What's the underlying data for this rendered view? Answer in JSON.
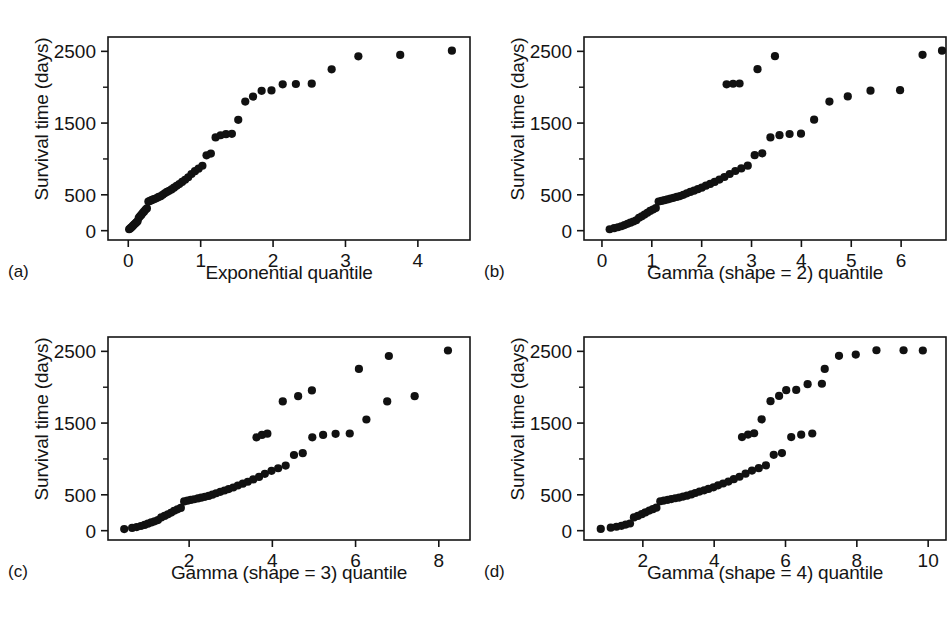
{
  "figure": {
    "background": "#ffffff",
    "ink_color": "#141414",
    "marker_color": "#111111",
    "panel_count": 4
  },
  "chart_data": [
    {
      "type": "scatter",
      "panel": "a",
      "panel_tag": "(a)",
      "title": "",
      "xlabel": "Exponential quantile",
      "ylabel": "Survival time (days)",
      "xlim": [
        -0.28,
        4.72
      ],
      "ylim": [
        -130,
        2700
      ],
      "xticks": [
        0,
        1,
        2,
        3,
        4
      ],
      "xtick_labels": [
        "0",
        "1",
        "2",
        "3",
        "4"
      ],
      "yticks": [
        0,
        500,
        1500,
        2500
      ],
      "ytick_labels": [
        "0",
        "500",
        "1500",
        "2500"
      ],
      "yminorticks": [
        1000,
        2000
      ],
      "grid": false,
      "legend": null,
      "x": [
        0.012,
        0.025,
        0.038,
        0.052,
        0.066,
        0.081,
        0.096,
        0.112,
        0.128,
        0.145,
        0.162,
        0.18,
        0.198,
        0.217,
        0.237,
        0.257,
        0.278,
        0.3,
        0.322,
        0.345,
        0.369,
        0.394,
        0.42,
        0.447,
        0.475,
        0.504,
        0.534,
        0.565,
        0.598,
        0.632,
        0.668,
        0.705,
        0.744,
        0.785,
        0.828,
        0.873,
        0.921,
        0.971,
        1.024,
        1.081,
        1.141,
        1.206,
        1.275,
        1.35,
        1.431,
        1.519,
        1.616,
        1.723,
        1.842,
        1.978,
        2.133,
        2.315,
        2.534,
        2.809,
        3.178,
        3.756,
        4.47
      ],
      "y": [
        20,
        30,
        42,
        55,
        70,
        85,
        100,
        115,
        130,
        180,
        200,
        220,
        245,
        265,
        290,
        310,
        405,
        415,
        425,
        435,
        445,
        455,
        470,
        480,
        500,
        520,
        540,
        555,
        575,
        600,
        625,
        650,
        680,
        710,
        745,
        790,
        830,
        865,
        905,
        1050,
        1075,
        1300,
        1330,
        1345,
        1350,
        1545,
        1800,
        1870,
        1950,
        1955,
        2040,
        2045,
        2050,
        2250,
        2430,
        2450,
        2510
      ]
    },
    {
      "type": "scatter",
      "panel": "b",
      "panel_tag": "(b)",
      "title": "",
      "xlabel": "Gamma (shape = 2) quantile",
      "ylabel": "Survival time (days)",
      "xlim": [
        -0.36,
        6.9
      ],
      "ylim": [
        -130,
        2700
      ],
      "xticks": [
        0,
        1,
        2,
        3,
        4,
        5,
        6
      ],
      "xtick_labels": [
        "0",
        "1",
        "2",
        "3",
        "4",
        "5",
        "6"
      ],
      "yticks": [
        0,
        500,
        1500,
        2500
      ],
      "ytick_labels": [
        "0",
        "500",
        "1500",
        "2500"
      ],
      "yminorticks": [
        1000,
        2000
      ],
      "grid": false,
      "legend": null,
      "x": [
        0.155,
        0.245,
        0.32,
        0.388,
        0.452,
        0.513,
        0.572,
        0.63,
        0.687,
        0.743,
        0.799,
        0.855,
        0.911,
        0.967,
        1.023,
        1.08,
        1.137,
        1.195,
        1.254,
        1.314,
        1.375,
        1.437,
        1.501,
        1.566,
        1.633,
        1.702,
        1.773,
        1.847,
        1.923,
        2.002,
        2.085,
        2.171,
        2.261,
        2.356,
        2.456,
        2.562,
        2.675,
        2.795,
        2.924,
        3.063,
        3.214,
        3.379,
        3.561,
        3.763,
        3.992,
        4.255,
        4.562,
        4.93,
        5.386,
        5.979,
        6.82,
        2.5,
        2.63,
        2.76,
        3.12,
        3.47,
        6.43
      ],
      "y": [
        20,
        35,
        48,
        62,
        78,
        95,
        112,
        128,
        145,
        180,
        200,
        225,
        250,
        275,
        295,
        315,
        405,
        415,
        425,
        435,
        448,
        458,
        470,
        482,
        500,
        520,
        540,
        558,
        578,
        600,
        628,
        652,
        680,
        712,
        748,
        790,
        832,
        868,
        906,
        1052,
        1078,
        1300,
        1332,
        1348,
        1352,
        1548,
        1800,
        1872,
        1952,
        1958,
        2510,
        2040,
        2048,
        2052,
        2252,
        2432,
        2452
      ]
    },
    {
      "type": "scatter",
      "panel": "c",
      "panel_tag": "(c)",
      "title": "",
      "xlabel": "Gamma (shape = 3) quantile",
      "ylabel": "Survival time (days)",
      "xlim": [
        0.05,
        8.75
      ],
      "ylim": [
        -130,
        2700
      ],
      "xticks": [
        2,
        4,
        6,
        8
      ],
      "xtick_labels": [
        "2",
        "4",
        "6",
        "8"
      ],
      "yticks": [
        0,
        500,
        1500,
        2500
      ],
      "ytick_labels": [
        "0",
        "500",
        "1500",
        "2500"
      ],
      "yminorticks": [
        1000,
        2000
      ],
      "grid": false,
      "legend": null,
      "x": [
        0.44,
        0.63,
        0.74,
        0.84,
        0.93,
        1.01,
        1.09,
        1.17,
        1.25,
        1.33,
        1.41,
        1.49,
        1.57,
        1.64,
        1.72,
        1.8,
        1.88,
        1.96,
        2.04,
        2.12,
        2.21,
        2.29,
        2.38,
        2.47,
        2.56,
        2.65,
        2.75,
        2.85,
        2.95,
        3.06,
        3.17,
        3.29,
        3.41,
        3.54,
        3.68,
        3.82,
        3.98,
        4.14,
        4.32,
        4.52,
        4.73,
        4.96,
        5.22,
        5.52,
        5.86,
        6.26,
        6.76,
        7.42,
        8.22,
        3.62,
        3.75,
        3.88,
        4.25,
        4.62,
        4.95,
        6.08,
        6.8
      ],
      "y": [
        22,
        38,
        50,
        65,
        80,
        98,
        115,
        130,
        148,
        185,
        205,
        228,
        252,
        278,
        298,
        318,
        408,
        418,
        428,
        438,
        450,
        460,
        472,
        485,
        502,
        522,
        542,
        560,
        580,
        602,
        630,
        655,
        682,
        715,
        750,
        792,
        835,
        870,
        908,
        1055,
        1080,
        1302,
        1335,
        1350,
        1355,
        1550,
        1802,
        1875,
        2512,
        1302,
        1335,
        1352,
        1802,
        1875,
        1955,
        2255,
        2435
      ]
    },
    {
      "type": "scatter",
      "panel": "d",
      "panel_tag": "(d)",
      "title": "",
      "xlabel": "Gamma (shape = 4) quantile",
      "ylabel": "Survival time (days)",
      "xlim": [
        0.35,
        10.5
      ],
      "ylim": [
        -130,
        2700
      ],
      "xticks": [
        2,
        4,
        6,
        8,
        10
      ],
      "xtick_labels": [
        "2",
        "4",
        "6",
        "8",
        "10"
      ],
      "yticks": [
        0,
        500,
        1500,
        2500
      ],
      "ytick_labels": [
        "0",
        "500",
        "1500",
        "2500"
      ],
      "yminorticks": [
        1000,
        2000
      ],
      "grid": false,
      "legend": null,
      "x": [
        0.82,
        1.1,
        1.26,
        1.4,
        1.52,
        1.64,
        1.75,
        1.86,
        1.97,
        2.07,
        2.18,
        2.28,
        2.38,
        2.49,
        2.59,
        2.7,
        2.8,
        2.91,
        3.02,
        3.13,
        3.24,
        3.36,
        3.47,
        3.59,
        3.72,
        3.84,
        3.98,
        4.11,
        4.25,
        4.4,
        4.55,
        4.71,
        4.88,
        5.06,
        5.25,
        5.45,
        5.67,
        5.9,
        6.16,
        6.44,
        6.75,
        7.1,
        7.5,
        7.97,
        8.55,
        9.31,
        9.85,
        4.78,
        4.95,
        5.12,
        5.33,
        5.58,
        5.82,
        6.02,
        6.3,
        6.62,
        7.02
      ],
      "y": [
        25,
        42,
        55,
        68,
        85,
        100,
        185,
        205,
        230,
        255,
        280,
        300,
        320,
        410,
        420,
        430,
        440,
        452,
        462,
        475,
        488,
        505,
        525,
        545,
        562,
        582,
        605,
        632,
        658,
        685,
        718,
        752,
        795,
        838,
        872,
        910,
        1058,
        1082,
        1305,
        1338,
        1355,
        2255,
        2438,
        2455,
        2515,
        2515,
        2512,
        1305,
        1340,
        1358,
        1552,
        1805,
        1878,
        1958,
        1962,
        2042,
        2048
      ]
    }
  ],
  "caption": ""
}
